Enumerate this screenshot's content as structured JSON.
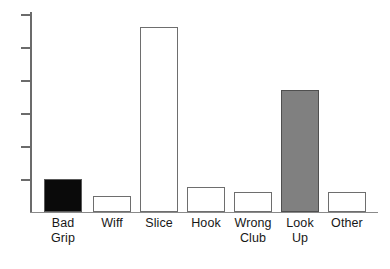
{
  "chart_data": {
    "type": "bar",
    "title": "",
    "subtitle": "",
    "xlabel": "",
    "ylabel": "",
    "categories": [
      "Bad Grip",
      "Wiff",
      "Slice",
      "Hook",
      "Wrong Club",
      "Look Up",
      "Other"
    ],
    "category_lines": [
      [
        "Bad",
        "Grip"
      ],
      [
        "Wiff"
      ],
      [
        "Slice"
      ],
      [
        "Hook"
      ],
      [
        "Wrong",
        "Club"
      ],
      [
        "Look",
        "Up"
      ],
      [
        "Other"
      ]
    ],
    "values": [
      1.0,
      0.5,
      5.6,
      0.75,
      0.6,
      3.7,
      0.6
    ],
    "bar_fills": [
      "black",
      "white",
      "white",
      "white",
      "white",
      "gray",
      "white"
    ],
    "bar_colors": [
      "#0a0a0a",
      "#ffffff",
      "#ffffff",
      "#ffffff",
      "#ffffff",
      "#808080",
      "#ffffff"
    ],
    "bar_outline_color": "#6e6e6e",
    "ylim": [
      0,
      6.1
    ],
    "xlim": [
      0,
      7
    ],
    "yticks": [
      1,
      2,
      3,
      4,
      5,
      6
    ],
    "ytick_labels": [
      "",
      "",
      "",
      "",
      "",
      ""
    ],
    "grid": false,
    "legend": null,
    "legend_position": "none",
    "annotations": [],
    "axis_color": "#6b6b6b",
    "baseline_color": "#8a8a8a",
    "background_color": "#ffffff"
  },
  "geometry": {
    "baseline_y": 212,
    "axis_x": 31,
    "axis_top_y": 12,
    "plot_width": 347,
    "bar_width": 38,
    "tick_spacing": 33,
    "bar_lefts": [
      44,
      93,
      140,
      187,
      234,
      281,
      328
    ],
    "bar_tops": [
      180,
      196,
      28,
      188,
      192,
      90,
      192
    ]
  }
}
